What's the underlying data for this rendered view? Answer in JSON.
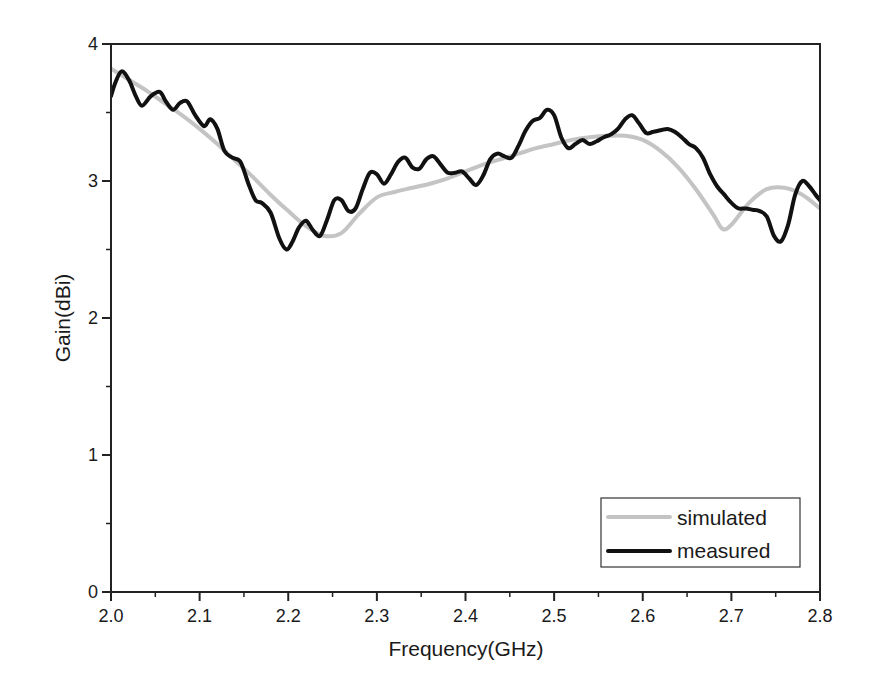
{
  "chart_data": {
    "type": "line",
    "title": "",
    "xlabel": "Frequency(GHz)",
    "ylabel": "Gain(dBi)",
    "xlim": [
      2.0,
      2.8
    ],
    "ylim": [
      0,
      4
    ],
    "xticks": [
      "2.0",
      "2.1",
      "2.2",
      "2.3",
      "2.4",
      "2.5",
      "2.6",
      "2.7",
      "2.8"
    ],
    "yticks": [
      "0",
      "1",
      "2",
      "3",
      "4"
    ],
    "grid": false,
    "legend_position": "lower right",
    "series": [
      {
        "name": "simulated",
        "color": "#c4c4c4",
        "width": 4,
        "x": [
          2.0,
          2.02,
          2.04,
          2.06,
          2.08,
          2.1,
          2.12,
          2.14,
          2.16,
          2.18,
          2.2,
          2.22,
          2.24,
          2.26,
          2.28,
          2.3,
          2.32,
          2.34,
          2.36,
          2.38,
          2.4,
          2.42,
          2.44,
          2.46,
          2.48,
          2.5,
          2.52,
          2.54,
          2.56,
          2.58,
          2.6,
          2.62,
          2.64,
          2.66,
          2.68,
          2.69,
          2.7,
          2.72,
          2.74,
          2.76,
          2.78,
          2.8
        ],
        "y": [
          3.82,
          3.74,
          3.66,
          3.57,
          3.48,
          3.38,
          3.27,
          3.15,
          3.03,
          2.9,
          2.78,
          2.67,
          2.6,
          2.62,
          2.76,
          2.88,
          2.92,
          2.95,
          2.98,
          3.02,
          3.07,
          3.12,
          3.16,
          3.2,
          3.24,
          3.27,
          3.3,
          3.32,
          3.33,
          3.33,
          3.3,
          3.22,
          3.1,
          2.94,
          2.75,
          2.65,
          2.68,
          2.84,
          2.94,
          2.95,
          2.9,
          2.8
        ]
      },
      {
        "name": "measured",
        "color": "#111111",
        "width": 4,
        "x": [
          2.0,
          2.005,
          2.012,
          2.02,
          2.028,
          2.035,
          2.045,
          2.055,
          2.062,
          2.07,
          2.078,
          2.086,
          2.095,
          2.105,
          2.112,
          2.12,
          2.128,
          2.137,
          2.146,
          2.155,
          2.163,
          2.17,
          2.18,
          2.19,
          2.198,
          2.205,
          2.212,
          2.22,
          2.228,
          2.236,
          2.244,
          2.252,
          2.26,
          2.268,
          2.276,
          2.284,
          2.292,
          2.3,
          2.308,
          2.316,
          2.324,
          2.332,
          2.34,
          2.348,
          2.356,
          2.364,
          2.372,
          2.38,
          2.388,
          2.396,
          2.404,
          2.412,
          2.42,
          2.428,
          2.436,
          2.444,
          2.452,
          2.46,
          2.468,
          2.476,
          2.484,
          2.492,
          2.5,
          2.508,
          2.516,
          2.524,
          2.532,
          2.54,
          2.548,
          2.556,
          2.564,
          2.572,
          2.58,
          2.588,
          2.596,
          2.604,
          2.612,
          2.62,
          2.628,
          2.636,
          2.644,
          2.652,
          2.66,
          2.668,
          2.676,
          2.684,
          2.692,
          2.7,
          2.708,
          2.716,
          2.724,
          2.732,
          2.74,
          2.748,
          2.756,
          2.764,
          2.772,
          2.78,
          2.788,
          2.795,
          2.8
        ],
        "y": [
          3.62,
          3.72,
          3.8,
          3.74,
          3.62,
          3.55,
          3.62,
          3.65,
          3.58,
          3.52,
          3.57,
          3.58,
          3.48,
          3.4,
          3.45,
          3.38,
          3.22,
          3.17,
          3.14,
          2.98,
          2.86,
          2.84,
          2.77,
          2.58,
          2.5,
          2.56,
          2.66,
          2.71,
          2.64,
          2.6,
          2.72,
          2.86,
          2.86,
          2.78,
          2.8,
          2.94,
          3.06,
          3.05,
          2.98,
          3.05,
          3.14,
          3.17,
          3.1,
          3.09,
          3.16,
          3.18,
          3.12,
          3.06,
          3.06,
          3.07,
          3.02,
          2.97,
          3.04,
          3.16,
          3.2,
          3.18,
          3.17,
          3.26,
          3.37,
          3.44,
          3.46,
          3.52,
          3.48,
          3.32,
          3.24,
          3.27,
          3.3,
          3.27,
          3.29,
          3.32,
          3.34,
          3.38,
          3.45,
          3.48,
          3.42,
          3.35,
          3.36,
          3.37,
          3.38,
          3.36,
          3.32,
          3.27,
          3.24,
          3.17,
          3.05,
          2.96,
          2.9,
          2.84,
          2.8,
          2.8,
          2.79,
          2.78,
          2.74,
          2.6,
          2.56,
          2.68,
          2.9,
          3.0,
          2.96,
          2.9,
          2.86
        ]
      }
    ]
  },
  "plot": {
    "frame_color": "#222222",
    "background": "#ffffff"
  }
}
